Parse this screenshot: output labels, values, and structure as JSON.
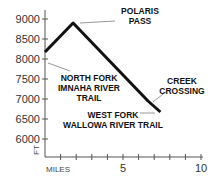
{
  "chart_data": {
    "type": "line",
    "title": "",
    "xlabel": "MILES",
    "ylabel": "FT",
    "xlim": [
      0,
      10
    ],
    "ylim": [
      5600,
      9200
    ],
    "x_ticks": [
      1,
      2,
      3,
      4,
      5,
      6,
      7,
      8,
      9,
      10
    ],
    "x_tick_labels": [
      {
        "value": 5,
        "label": "5"
      },
      {
        "value": 10,
        "label": "10"
      }
    ],
    "y_ticks": [
      {
        "value": 9000,
        "label": "9000"
      },
      {
        "value": 8500,
        "label": "8500"
      },
      {
        "value": 8000,
        "label": "8000"
      },
      {
        "value": 7500,
        "label": "7500"
      },
      {
        "value": 7000,
        "label": "7000"
      },
      {
        "value": 6500,
        "label": "6500"
      },
      {
        "value": 6000,
        "label": "6000"
      }
    ],
    "grid": false,
    "series": [
      {
        "name": "Trail elevation profile",
        "x": [
          0,
          1.8,
          6.6,
          7.4
        ],
        "values": [
          8175,
          8900,
          6950,
          6675
        ]
      }
    ],
    "annotations": [
      {
        "id": "polaris",
        "lines": [
          "POLARIS",
          "PASS"
        ],
        "x": 1.8,
        "y": 8900
      },
      {
        "id": "north_fork",
        "lines": [
          "NORTH FORK",
          "IMNAHA RIVER",
          "TRAIL"
        ],
        "x": 0,
        "y": 8175
      },
      {
        "id": "creek",
        "lines": [
          "CREEK",
          "CROSSING"
        ],
        "x": 6.6,
        "y": 6950
      },
      {
        "id": "west_fork",
        "lines": [
          "WEST FORK",
          "WALLOWA RIVER TRAIL"
        ],
        "x": 7.4,
        "y": 6675
      }
    ]
  },
  "style": {
    "line_color": "#111111",
    "axis_color": "#555555",
    "leader_color": "#999999"
  }
}
